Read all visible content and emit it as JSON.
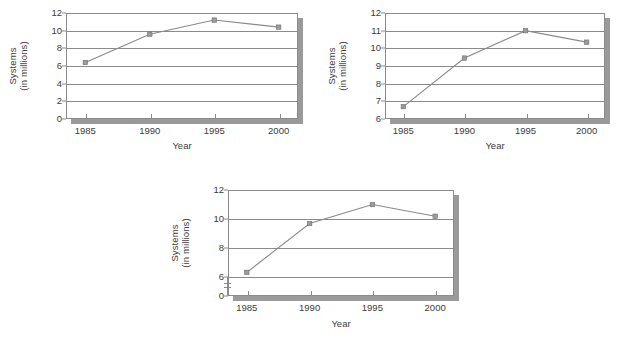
{
  "figure": {
    "background": "#ffffff",
    "line_color": "#8a8a8a",
    "marker_color": "#9b9b9b",
    "axis_color": "#8b8b8b",
    "shadow_color": "#9a9a9a",
    "text_color": "#3c3c3c"
  },
  "chart_data": [
    {
      "id": "chart-1",
      "type": "line",
      "title": "",
      "xlabel": "Year",
      "ylabel": "Systems\n(in millions)",
      "ylabel_line1": "Systems",
      "ylabel_line2": "(in millions)",
      "categories": [
        "1985",
        "1990",
        "1995",
        "2000"
      ],
      "x": [
        1985,
        1990,
        1995,
        2000
      ],
      "values": [
        6.4,
        9.6,
        11.2,
        10.4
      ],
      "ylim": [
        0,
        12
      ],
      "yticks": [
        0,
        2,
        4,
        6,
        8,
        10,
        12
      ],
      "ytick_labels": [
        "0",
        "2",
        "4",
        "6",
        "8",
        "10",
        "12"
      ],
      "xlim": [
        1983.5,
        2001.5
      ],
      "grid": "horizontal",
      "legend": "none",
      "axis_break": false
    },
    {
      "id": "chart-2",
      "type": "line",
      "title": "",
      "xlabel": "Year",
      "ylabel": "Systems\n(in millions)",
      "ylabel_line1": "Systems",
      "ylabel_line2": "(in millions)",
      "categories": [
        "1985",
        "1990",
        "1995",
        "2000"
      ],
      "x": [
        1985,
        1990,
        1995,
        2000
      ],
      "values": [
        6.7,
        9.45,
        11.0,
        10.35
      ],
      "ylim": [
        6,
        12
      ],
      "yticks": [
        6,
        7,
        8,
        9,
        10,
        11,
        12
      ],
      "ytick_labels": [
        "6",
        "7",
        "8",
        "9",
        "10",
        "11",
        "12"
      ],
      "xlim": [
        1983.5,
        2001.5
      ],
      "grid": "horizontal",
      "legend": "none",
      "axis_break": false
    },
    {
      "id": "chart-3",
      "type": "line",
      "title": "",
      "xlabel": "Year",
      "ylabel": "Systems\n(in millions)",
      "ylabel_line1": "Systems",
      "ylabel_line2": "(in millions)",
      "categories": [
        "1985",
        "1990",
        "1995",
        "2000"
      ],
      "x": [
        1985,
        1990,
        1995,
        2000
      ],
      "values": [
        6.35,
        9.7,
        11.0,
        10.2
      ],
      "ylim": [
        0,
        12
      ],
      "yticks": [
        0,
        6,
        8,
        10,
        12
      ],
      "ytick_labels": [
        "0",
        "6",
        "8",
        "10",
        "12"
      ],
      "xlim": [
        1983.5,
        2001.5
      ],
      "grid": "horizontal",
      "legend": "none",
      "axis_break": true,
      "axis_break_note": "y-axis broken between 0 and 6"
    }
  ]
}
